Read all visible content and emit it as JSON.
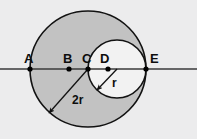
{
  "figure": {
    "canvas": {
      "width": 197,
      "height": 139
    },
    "colors": {
      "background": "#ececed",
      "large_circle_fill": "#c2c2c2",
      "small_circle_fill": "#f2f2f2",
      "stroke": "#121212",
      "line": "#3a3a3a",
      "point": "#000000",
      "label_text": "#0d0d0d"
    },
    "axis_line": {
      "name": "horizontal-line",
      "y": 69,
      "x_start": 0,
      "x_end": 197
    },
    "shapes": [
      {
        "id": "large-circle",
        "kind": "circle",
        "cx": 88,
        "cy": 69,
        "r": 58,
        "fill": "#c2c2c2",
        "radius_label": "2r"
      },
      {
        "id": "small-circle",
        "kind": "circle",
        "cx": 117,
        "cy": 69,
        "r": 29,
        "fill": "#f2f2f2",
        "radius_label": "r"
      }
    ],
    "points": [
      {
        "id": "A",
        "label": "A",
        "x": 30,
        "y": 69,
        "label_x": 24,
        "label_y": 63
      },
      {
        "id": "B",
        "label": "B",
        "x": 69,
        "y": 69,
        "label_x": 63,
        "label_y": 63
      },
      {
        "id": "C",
        "label": "C",
        "x": 88,
        "y": 69,
        "label_x": 82,
        "label_y": 63
      },
      {
        "id": "D",
        "label": "D",
        "x": 108,
        "y": 69,
        "label_x": 100,
        "label_y": 63
      },
      {
        "id": "E",
        "label": "E",
        "x": 146,
        "y": 69,
        "label_x": 150,
        "label_y": 63
      }
    ],
    "measures": [
      {
        "id": "radius-2r",
        "label": "2r",
        "from_x": 88,
        "from_y": 69,
        "to_x": 49,
        "to_y": 113,
        "label_x": 72,
        "label_y": 104
      },
      {
        "id": "radius-r",
        "label": "r",
        "from_x": 117,
        "from_y": 69,
        "to_x": 97,
        "to_y": 90,
        "label_x": 112,
        "label_y": 87
      }
    ]
  }
}
